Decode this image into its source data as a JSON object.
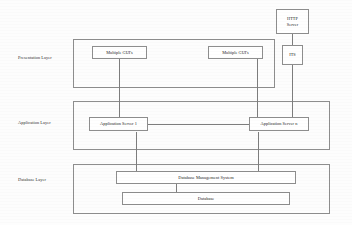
{
  "diagram": {
    "layers": [
      {
        "id": "presentation",
        "caption": "Presentation Layer"
      },
      {
        "id": "application",
        "caption": "Application Layer"
      },
      {
        "id": "database",
        "caption": "Database Layer"
      }
    ],
    "nodes": {
      "http_server_line1": "HTTP",
      "http_server_line2": "Server",
      "its": "ITS",
      "gui_left": "Multiple GUI's",
      "gui_right": "Multiple GUI's",
      "app_server_1": "Application Server 1",
      "app_server_n": "Application Server n",
      "dbms": "Database Management System",
      "database": "Database"
    },
    "colors": {
      "stroke": "#8e8e8e",
      "line": "#7d7d7d",
      "text": "#222222",
      "background": "#fdfdfd"
    }
  }
}
